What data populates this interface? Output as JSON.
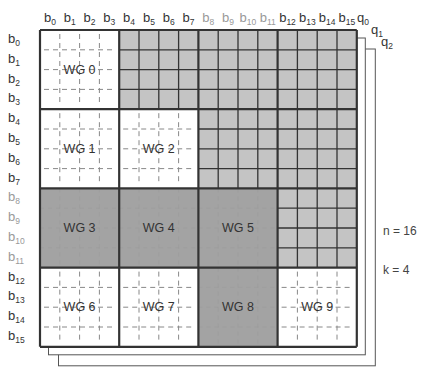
{
  "diagram": {
    "n_label": "n = 16",
    "k_label": "k = 4",
    "layers": [
      "q0",
      "q1",
      "q2"
    ],
    "column_labels": [
      "b0",
      "b1",
      "b2",
      "b3",
      "b4",
      "b5",
      "b6",
      "b7",
      "b8",
      "b9",
      "b10",
      "b11",
      "b12",
      "b13",
      "b14",
      "b15"
    ],
    "row_labels": [
      "b0",
      "b1",
      "b2",
      "b3",
      "b4",
      "b5",
      "b6",
      "b7",
      "b8",
      "b9",
      "b10",
      "b11",
      "b12",
      "b13",
      "b14",
      "b15"
    ],
    "gray_label_indices": [
      8,
      9,
      10,
      11
    ],
    "blocks": [
      {
        "row": 0,
        "col": 0,
        "type": "wg",
        "label": "WG 0"
      },
      {
        "row": 0,
        "col": 1,
        "type": "upper"
      },
      {
        "row": 0,
        "col": 2,
        "type": "upper"
      },
      {
        "row": 0,
        "col": 3,
        "type": "upper"
      },
      {
        "row": 1,
        "col": 0,
        "type": "wg",
        "label": "WG 1"
      },
      {
        "row": 1,
        "col": 1,
        "type": "wg",
        "label": "WG 2"
      },
      {
        "row": 1,
        "col": 2,
        "type": "upper"
      },
      {
        "row": 1,
        "col": 3,
        "type": "upper"
      },
      {
        "row": 2,
        "col": 0,
        "type": "wg-dark",
        "label": "WG 3"
      },
      {
        "row": 2,
        "col": 1,
        "type": "wg-dark",
        "label": "WG 4"
      },
      {
        "row": 2,
        "col": 2,
        "type": "wg-dark",
        "label": "WG 5"
      },
      {
        "row": 2,
        "col": 3,
        "type": "upper"
      },
      {
        "row": 3,
        "col": 0,
        "type": "wg",
        "label": "WG 6"
      },
      {
        "row": 3,
        "col": 1,
        "type": "wg",
        "label": "WG 7"
      },
      {
        "row": 3,
        "col": 2,
        "type": "wg-dark",
        "label": "WG 8"
      },
      {
        "row": 3,
        "col": 3,
        "type": "wg",
        "label": "WG 9"
      }
    ],
    "colors": {
      "upper_fill": "#c4c4c4",
      "dark_fill": "#a3a3a3",
      "white_fill": "#ffffff",
      "line": "#333333",
      "dashed": "#888888"
    }
  }
}
